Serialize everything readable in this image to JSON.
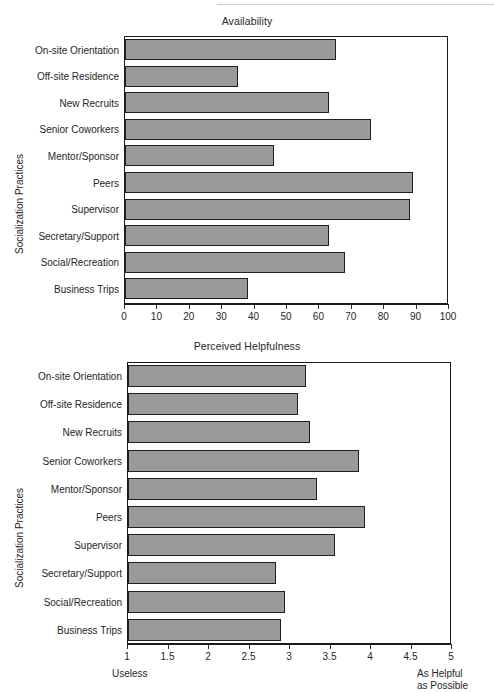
{
  "page": {
    "categories_axis_label": "Socialization Practices"
  },
  "charts": [
    {
      "id": "availability",
      "title": "Availability",
      "ylabel": "Socialization Practices",
      "xlabel": "",
      "xticks": [
        "0",
        "10",
        "20",
        "30",
        "40",
        "50",
        "60",
        "70",
        "80",
        "90",
        "100"
      ]
    },
    {
      "id": "helpfulness",
      "title": "Perceived Helpfulness",
      "ylabel": "Socialization Practices",
      "xlabel": "",
      "xticks": [
        "1",
        "1.5",
        "2",
        "2.5",
        "3",
        "3.5",
        "4",
        "4.5",
        "5"
      ],
      "left_endcap": "Useless",
      "right_endcap_line1": "As Helpful",
      "right_endcap_line2": "as Possible"
    }
  ],
  "chart_data": [
    {
      "type": "bar",
      "orientation": "horizontal",
      "title": "Availability",
      "xlabel": "",
      "ylabel": "Socialization Practices",
      "xlim": [
        0,
        100
      ],
      "grid": false,
      "legend": "none",
      "xticks": [
        0,
        10,
        20,
        30,
        40,
        50,
        60,
        70,
        80,
        90,
        100
      ],
      "categories": [
        "On-site Orientation",
        "Off-site Residence",
        "New Recruits",
        "Senior Coworkers",
        "Mentor/Sponsor",
        "Peers",
        "Supervisor",
        "Secretary/Support",
        "Social/Recreation",
        "Business Trips"
      ],
      "values": [
        65,
        35,
        63,
        76,
        46,
        89,
        88,
        63,
        68,
        38
      ]
    },
    {
      "type": "bar",
      "orientation": "horizontal",
      "title": "Perceived Helpfulness",
      "xlabel": "",
      "ylabel": "Socialization Practices",
      "xlim": [
        1,
        5
      ],
      "grid": false,
      "legend": "none",
      "xticks": [
        1,
        1.5,
        2,
        2.5,
        3,
        3.5,
        4,
        4.5,
        5
      ],
      "axis_endpoint_labels": {
        "left": "Useless",
        "right": "As Helpful as Possible"
      },
      "categories": [
        "On-site Orientation",
        "Off-site Residence",
        "New Recruits",
        "Senior Coworkers",
        "Mentor/Sponsor",
        "Peers",
        "Supervisor",
        "Secretary/Support",
        "Social/Recreation",
        "Business Trips"
      ],
      "values": [
        3.2,
        3.1,
        3.25,
        3.85,
        3.33,
        3.93,
        3.55,
        2.83,
        2.94,
        2.89
      ]
    }
  ],
  "colors": {
    "bar_fill": "#9a9a9a",
    "bar_stroke": "#1f1f1f",
    "axis": "#1a1a1a",
    "text": "#262626",
    "background": "#ffffff"
  }
}
